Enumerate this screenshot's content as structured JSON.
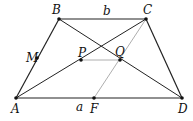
{
  "figure": {
    "type": "trapezoid-geometry",
    "points": {
      "A": {
        "label": "A",
        "x": 16,
        "y": 98
      },
      "B": {
        "label": "B",
        "x": 59,
        "y": 19
      },
      "C": {
        "label": "C",
        "x": 146,
        "y": 19
      },
      "D": {
        "label": "D",
        "x": 182,
        "y": 98
      },
      "M": {
        "label": "M",
        "x": 37,
        "y": 58
      },
      "P": {
        "label": "P",
        "x": 81,
        "y": 60
      },
      "Q": {
        "label": "Q",
        "x": 120,
        "y": 60
      },
      "F": {
        "label": "F",
        "x": 94,
        "y": 98
      }
    },
    "side_labels": {
      "top": "b",
      "bottom": "a"
    },
    "segments": [
      {
        "from": "A",
        "to": "B",
        "style": "dark"
      },
      {
        "from": "B",
        "to": "C",
        "style": "dark"
      },
      {
        "from": "C",
        "to": "D",
        "style": "dark"
      },
      {
        "from": "A",
        "to": "D",
        "style": "dark"
      },
      {
        "from": "A",
        "to": "C",
        "style": "dark"
      },
      {
        "from": "B",
        "to": "D",
        "style": "dark"
      },
      {
        "from": "C",
        "to": "F",
        "style": "light"
      },
      {
        "from": "P",
        "to": "Q",
        "style": "light"
      }
    ],
    "colors": {
      "line": "#222222",
      "light_line": "#999999",
      "point": "#111111"
    }
  }
}
